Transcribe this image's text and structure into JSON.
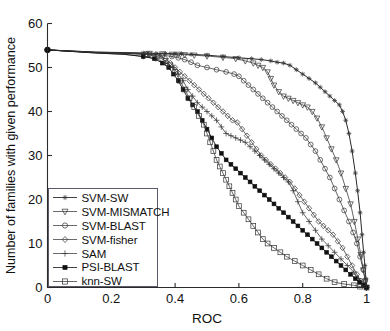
{
  "figure": {
    "background": "#ffffff",
    "line_color": "#333333"
  },
  "chart_data": {
    "type": "line",
    "title": "",
    "xlabel": "ROC",
    "ylabel": "Number of families with given performance",
    "xlim": [
      0,
      1
    ],
    "ylim": [
      0,
      60
    ],
    "xticks": [
      0,
      0.2,
      0.4,
      0.6,
      0.8,
      1
    ],
    "xticklabels": [
      "0",
      "0.2",
      "0.4",
      "0.6",
      "0.8",
      "1"
    ],
    "yticks": [
      0,
      10,
      20,
      30,
      40,
      50,
      60
    ],
    "yticklabels": [
      "0",
      "10",
      "20",
      "30",
      "40",
      "50",
      "60"
    ],
    "grid": false,
    "legend_position": "lower-left",
    "series": [
      {
        "name": "SVM-SW",
        "marker": "asterisk",
        "x": [
          0.0,
          0.15,
          0.24,
          0.3,
          0.34,
          0.37,
          0.4,
          0.42,
          0.45,
          0.5,
          0.55,
          0.6,
          0.64,
          0.67,
          0.7,
          0.72,
          0.74,
          0.76,
          0.78,
          0.8,
          0.82,
          0.84,
          0.855,
          0.87,
          0.885,
          0.9,
          0.915,
          0.925,
          0.935,
          0.945,
          0.955,
          0.965,
          0.972,
          0.98,
          0.986,
          0.991,
          0.995,
          0.998,
          1.0
        ],
        "y": [
          54,
          53.5,
          53.4,
          53.3,
          53.2,
          53.2,
          53.1,
          53.1,
          53.0,
          52.8,
          52.5,
          52.2,
          52.0,
          51.8,
          51.5,
          51.2,
          51.0,
          50.5,
          49.5,
          48.5,
          47.5,
          46.5,
          45.5,
          44.5,
          43.5,
          42.5,
          41.5,
          40.0,
          38.0,
          35.0,
          31.0,
          26.0,
          22.0,
          17.0,
          12.0,
          8.0,
          5.0,
          2.0,
          0
        ]
      },
      {
        "name": "SVM-MISMATCH",
        "marker": "triangle-down",
        "x": [
          0.0,
          0.15,
          0.25,
          0.32,
          0.36,
          0.39,
          0.41,
          0.43,
          0.46,
          0.5,
          0.55,
          0.59,
          0.62,
          0.645,
          0.66,
          0.675,
          0.69,
          0.7,
          0.71,
          0.725,
          0.74,
          0.755,
          0.77,
          0.785,
          0.8,
          0.815,
          0.83,
          0.845,
          0.86,
          0.875,
          0.89,
          0.905,
          0.92,
          0.935,
          0.95,
          0.962,
          0.973,
          0.982,
          0.99,
          0.996,
          1.0
        ],
        "y": [
          54,
          53.5,
          53.3,
          53.2,
          53.1,
          53.0,
          53.0,
          52.9,
          52.8,
          52.6,
          52.3,
          52.0,
          51.5,
          51.0,
          50.5,
          50.0,
          49.0,
          47.5,
          46.0,
          44.5,
          43.5,
          43.0,
          42.5,
          42.0,
          41.5,
          41.0,
          40.0,
          38.5,
          36.5,
          34.0,
          31.5,
          29.0,
          26.0,
          22.5,
          19.0,
          15.0,
          11.0,
          7.5,
          4.0,
          1.5,
          0
        ]
      },
      {
        "name": "SVM-BLAST",
        "marker": "circle",
        "x": [
          0.0,
          0.15,
          0.25,
          0.32,
          0.36,
          0.39,
          0.41,
          0.43,
          0.45,
          0.47,
          0.5,
          0.53,
          0.56,
          0.585,
          0.6,
          0.615,
          0.63,
          0.645,
          0.66,
          0.675,
          0.69,
          0.705,
          0.72,
          0.735,
          0.75,
          0.765,
          0.78,
          0.795,
          0.81,
          0.825,
          0.84,
          0.855,
          0.87,
          0.885,
          0.9,
          0.915,
          0.93,
          0.945,
          0.958,
          0.97,
          0.98,
          0.99,
          0.996,
          1.0
        ],
        "y": [
          54,
          53.4,
          53.2,
          53.0,
          52.8,
          52.5,
          52.2,
          51.8,
          51.2,
          50.5,
          50.0,
          49.5,
          49.0,
          48.5,
          48.0,
          47.0,
          46.0,
          45.0,
          44.0,
          43.0,
          42.0,
          41.0,
          40.0,
          39.0,
          38.0,
          37.0,
          36.0,
          35.0,
          34.0,
          32.5,
          31.0,
          29.0,
          27.0,
          25.0,
          22.5,
          20.0,
          17.5,
          15.0,
          12.5,
          10.0,
          7.0,
          4.0,
          1.5,
          0
        ]
      },
      {
        "name": "SVM-fisher",
        "marker": "diamond",
        "x": [
          0.0,
          0.15,
          0.25,
          0.31,
          0.345,
          0.37,
          0.385,
          0.4,
          0.415,
          0.43,
          0.445,
          0.46,
          0.475,
          0.49,
          0.505,
          0.52,
          0.535,
          0.55,
          0.565,
          0.58,
          0.595,
          0.61,
          0.625,
          0.64,
          0.655,
          0.67,
          0.685,
          0.7,
          0.715,
          0.73,
          0.745,
          0.76,
          0.775,
          0.79,
          0.805,
          0.82,
          0.835,
          0.85,
          0.865,
          0.88,
          0.895,
          0.91,
          0.925,
          0.94,
          0.955,
          0.97,
          0.982,
          0.992,
          1.0
        ],
        "y": [
          54,
          53.4,
          53.2,
          53.0,
          52.8,
          52.0,
          51.0,
          50.0,
          49.0,
          48.0,
          47.0,
          46.0,
          45.0,
          44.0,
          43.0,
          42.0,
          41.0,
          40.0,
          39.0,
          38.0,
          37.5,
          36.0,
          34.5,
          33.0,
          31.5,
          30.0,
          29.0,
          28.0,
          27.0,
          26.0,
          25.0,
          24.0,
          22.5,
          21.0,
          19.5,
          18.0,
          16.5,
          15.0,
          14.0,
          13.0,
          12.0,
          10.5,
          9.0,
          7.0,
          5.0,
          3.0,
          1.5,
          0.5,
          0
        ]
      },
      {
        "name": "SAM",
        "marker": "plus",
        "x": [
          0.0,
          0.15,
          0.24,
          0.3,
          0.34,
          0.37,
          0.395,
          0.41,
          0.425,
          0.44,
          0.455,
          0.47,
          0.485,
          0.5,
          0.515,
          0.53,
          0.545,
          0.56,
          0.575,
          0.59,
          0.605,
          0.62,
          0.635,
          0.65,
          0.665,
          0.68,
          0.695,
          0.71,
          0.725,
          0.74,
          0.755,
          0.77,
          0.785,
          0.8,
          0.82,
          0.84,
          0.86,
          0.88,
          0.9,
          0.92,
          0.94,
          0.96,
          0.975,
          0.99,
          1.0
        ],
        "y": [
          54,
          53.3,
          53.0,
          52.5,
          52.0,
          51.0,
          50.0,
          48.5,
          47.0,
          45.0,
          43.5,
          42.0,
          41.0,
          40.0,
          39.0,
          38.0,
          36.5,
          35.0,
          34.5,
          34.0,
          33.5,
          33.0,
          32.0,
          31.0,
          30.0,
          29.0,
          28.0,
          27.0,
          26.0,
          25.0,
          24.0,
          22.0,
          19.5,
          17.0,
          15.0,
          13.0,
          11.0,
          9.5,
          8.0,
          6.5,
          5.0,
          3.5,
          2.0,
          0.8,
          0
        ]
      },
      {
        "name": "PSI-BLAST",
        "marker": "square-filled",
        "x": [
          0.0,
          0.15,
          0.24,
          0.3,
          0.335,
          0.36,
          0.38,
          0.395,
          0.41,
          0.425,
          0.44,
          0.455,
          0.47,
          0.485,
          0.5,
          0.515,
          0.53,
          0.545,
          0.56,
          0.575,
          0.59,
          0.605,
          0.62,
          0.635,
          0.65,
          0.665,
          0.68,
          0.695,
          0.71,
          0.725,
          0.74,
          0.755,
          0.77,
          0.785,
          0.8,
          0.815,
          0.83,
          0.845,
          0.86,
          0.875,
          0.89,
          0.905,
          0.92,
          0.935,
          0.95,
          0.965,
          0.978,
          0.99,
          1.0
        ],
        "y": [
          54,
          53.3,
          53.0,
          52.5,
          52.0,
          51.0,
          50.0,
          48.5,
          47.0,
          45.0,
          43.0,
          41.5,
          40.0,
          38.0,
          36.0,
          34.0,
          32.0,
          30.5,
          29.0,
          28.0,
          27.0,
          26.0,
          25.0,
          24.0,
          23.0,
          22.0,
          21.0,
          20.0,
          19.0,
          18.0,
          17.0,
          16.0,
          15.0,
          14.0,
          13.0,
          12.0,
          11.0,
          10.0,
          9.0,
          8.0,
          7.0,
          6.0,
          5.0,
          4.0,
          3.0,
          2.0,
          1.2,
          0.5,
          0
        ]
      },
      {
        "name": "knn-SW",
        "marker": "square-open",
        "x": [
          0.0,
          0.15,
          0.25,
          0.31,
          0.345,
          0.37,
          0.385,
          0.4,
          0.415,
          0.43,
          0.445,
          0.46,
          0.475,
          0.49,
          0.5,
          0.51,
          0.52,
          0.53,
          0.54,
          0.55,
          0.56,
          0.57,
          0.58,
          0.59,
          0.6,
          0.615,
          0.63,
          0.645,
          0.66,
          0.675,
          0.69,
          0.71,
          0.73,
          0.75,
          0.775,
          0.8,
          0.825,
          0.85,
          0.875,
          0.9,
          0.93,
          0.96,
          0.98,
          1.0
        ],
        "y": [
          54,
          53.4,
          53.2,
          53.0,
          52.5,
          51.5,
          50.5,
          49.0,
          47.0,
          45.0,
          43.0,
          41.0,
          39.0,
          37.0,
          35.0,
          33.0,
          31.0,
          29.0,
          27.5,
          26.0,
          24.5,
          23.0,
          21.5,
          20.0,
          18.5,
          17.0,
          15.5,
          14.0,
          12.5,
          11.0,
          10.0,
          9.0,
          8.0,
          7.0,
          6.0,
          5.0,
          4.0,
          3.0,
          2.0,
          1.2,
          0.8,
          0.5,
          0.2,
          0
        ]
      }
    ]
  },
  "legend": {
    "entries": [
      {
        "label": "SVM-SW",
        "marker": "asterisk"
      },
      {
        "label": "SVM-MISMATCH",
        "marker": "triangle-down"
      },
      {
        "label": "SVM-BLAST",
        "marker": "circle"
      },
      {
        "label": "SVM-fisher",
        "marker": "diamond"
      },
      {
        "label": "SAM",
        "marker": "plus"
      },
      {
        "label": "PSI-BLAST",
        "marker": "square-filled"
      },
      {
        "label": "knn-SW",
        "marker": "square-open"
      }
    ]
  }
}
